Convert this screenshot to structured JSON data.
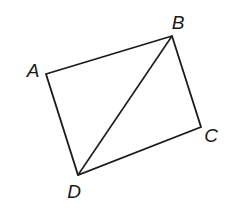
{
  "figure": {
    "type": "quadrilateral-with-diagonal",
    "stroke_color": "#1a1a1a",
    "vertices": [
      {
        "label": "A",
        "x": 46,
        "y": 74,
        "lx": 33,
        "ly": 77
      },
      {
        "label": "B",
        "x": 172,
        "y": 36,
        "lx": 178,
        "ly": 29
      },
      {
        "label": "C",
        "x": 201,
        "y": 127,
        "lx": 211,
        "ly": 142
      },
      {
        "label": "D",
        "x": 78,
        "y": 175,
        "lx": 74,
        "ly": 198
      }
    ],
    "segments": [
      "AB",
      "BC",
      "CD",
      "DA",
      "BD"
    ]
  }
}
